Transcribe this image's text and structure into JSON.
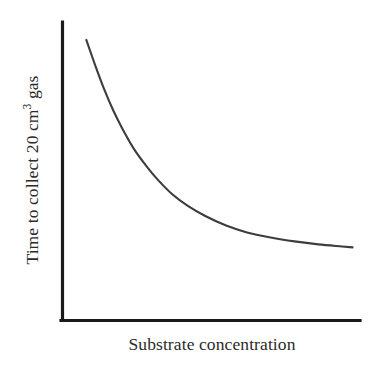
{
  "chart_data": {
    "type": "line",
    "title": "",
    "subtitle": "",
    "xlabel": "Substrate concentration",
    "ylabel_parts": {
      "before": "Time to collect 20 cm",
      "superscript": "3",
      "after": " gas"
    },
    "ylabel": "Time to collect 20 cm3 gas",
    "grid": false,
    "legend": false,
    "legend_position": "none",
    "x_tick_labels": [],
    "y_tick_labels": [],
    "xlim": [
      0,
      10
    ],
    "ylim": [
      0,
      10
    ],
    "series": [
      {
        "name": "time-to-collect-gas",
        "color": "#3d3d3d",
        "marker": "none",
        "linestyle": "solid",
        "x": [
          0.8,
          1.1,
          1.4,
          1.7,
          2.0,
          2.4,
          2.8,
          3.2,
          3.7,
          4.2,
          4.8,
          5.5,
          6.2,
          7.0,
          7.8,
          8.6,
          9.4,
          9.75
        ],
        "y": [
          9.4,
          8.55,
          7.75,
          7.05,
          6.45,
          5.75,
          5.2,
          4.72,
          4.22,
          3.85,
          3.5,
          3.18,
          2.95,
          2.78,
          2.65,
          2.55,
          2.48,
          2.45
        ]
      }
    ],
    "axis_color": "#1a1a1a",
    "background_color": "#ffffff"
  },
  "figure": {
    "background_color": "#ffffff"
  }
}
